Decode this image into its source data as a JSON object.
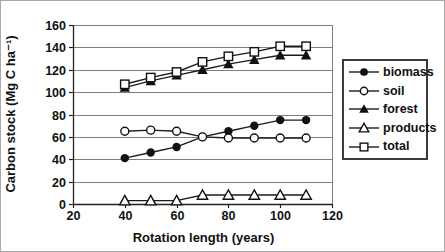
{
  "chart_data": {
    "type": "line",
    "title": "",
    "xlabel": "Rotation length (years)",
    "ylabel": "Carbon stock (Mg C ha⁻¹)",
    "xlim": [
      20,
      120
    ],
    "ylim": [
      0,
      160
    ],
    "x_ticks": [
      20,
      40,
      60,
      80,
      100,
      120
    ],
    "y_ticks": [
      0,
      20,
      40,
      60,
      80,
      100,
      120,
      140,
      160
    ],
    "grid": "horizontal-only",
    "legend_position": "right-outside-boxed",
    "x": [
      40,
      50,
      60,
      70,
      80,
      90,
      100,
      110
    ],
    "series": [
      {
        "name": "biomass",
        "marker": "filled-circle",
        "values": [
          41,
          46,
          51,
          60,
          65,
          70,
          75,
          75
        ]
      },
      {
        "name": "soil",
        "marker": "open-circle",
        "values": [
          65,
          66,
          65,
          60,
          59,
          59,
          59,
          59
        ]
      },
      {
        "name": "forest",
        "marker": "filled-triangle",
        "values": [
          104,
          110,
          115,
          120,
          125,
          129,
          133,
          133
        ]
      },
      {
        "name": "products",
        "marker": "open-triangle",
        "values": [
          3,
          3,
          3,
          8,
          8,
          8,
          8,
          8
        ]
      },
      {
        "name": "total",
        "marker": "open-square",
        "values": [
          107,
          113,
          118,
          127,
          132,
          136,
          141,
          141
        ]
      }
    ],
    "colors": {
      "line": "#1c1c1c",
      "marker_dark": "#111111",
      "marker_light": "#ffffff",
      "grid": "#7f7f7f",
      "axis": "#222222",
      "text": "#111111",
      "legend_border": "#3a3a3a",
      "figure_border": "#a9a9a9",
      "background": "#ffffff"
    }
  }
}
